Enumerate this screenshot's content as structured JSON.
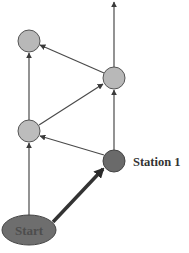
{
  "diagram": {
    "colors": {
      "background": "#ffffff",
      "edge": "#4a4a4a",
      "node_light": "#b8b8b8",
      "node_dark": "#6a6a6a",
      "node_stroke": "#555555",
      "label_text": "#333333",
      "start_text": "#555555"
    },
    "nodes": [
      {
        "id": "start",
        "label": "Start",
        "shape": "ellipse",
        "cx": 29,
        "cy": 230,
        "rx": 27,
        "ry": 15,
        "fill": "dark"
      },
      {
        "id": "station1",
        "label": "Station 1",
        "shape": "circle",
        "cx": 114,
        "cy": 161,
        "r": 11,
        "fill": "dark"
      },
      {
        "id": "left-mid",
        "label": "",
        "shape": "circle",
        "cx": 29,
        "cy": 131,
        "r": 11,
        "fill": "light"
      },
      {
        "id": "right-mid",
        "label": "",
        "shape": "circle",
        "cx": 114,
        "cy": 78,
        "r": 11,
        "fill": "light"
      },
      {
        "id": "left-top",
        "label": "",
        "shape": "circle",
        "cx": 29,
        "cy": 41,
        "r": 11,
        "fill": "light"
      }
    ],
    "edges": [
      {
        "from": "start",
        "to": "station1",
        "bold": true
      },
      {
        "from": "start",
        "to": "left-mid",
        "bold": false
      },
      {
        "from": "station1",
        "to": "left-mid",
        "bold": false
      },
      {
        "from": "station1",
        "to": "right-mid",
        "bold": false
      },
      {
        "from": "left-mid",
        "to": "right-mid",
        "bold": false
      },
      {
        "from": "left-mid",
        "to": "left-top",
        "bold": false
      },
      {
        "from": "right-mid",
        "to": "left-top",
        "bold": false
      },
      {
        "from": "right-mid",
        "to": "exit-top",
        "bold": false
      }
    ],
    "labels": {
      "start": "Start",
      "station1": "Station 1"
    }
  }
}
